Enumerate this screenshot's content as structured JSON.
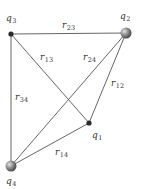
{
  "diagram": {
    "type": "point-charge-distances",
    "line_color": "#555555",
    "charges": [
      {
        "id": "q1",
        "symbol": "q",
        "sub": "1",
        "x": 89,
        "y": 123,
        "kind": "small-dot",
        "label_x": 92,
        "label_y": 138
      },
      {
        "id": "q2",
        "symbol": "q",
        "sub": "2",
        "x": 126,
        "y": 33,
        "kind": "sphere",
        "label_x": 120,
        "label_y": 19
      },
      {
        "id": "q3",
        "symbol": "q",
        "sub": "3",
        "x": 11,
        "y": 34,
        "kind": "small-dot",
        "label_x": 6,
        "label_y": 21
      },
      {
        "id": "q4",
        "symbol": "q",
        "sub": "4",
        "x": 11,
        "y": 166,
        "kind": "sphere",
        "label_x": 6,
        "label_y": 184
      }
    ],
    "distances": [
      {
        "id": "r12",
        "symbol": "r",
        "sub": "12",
        "from": "q1",
        "to": "q2",
        "label_x": 111,
        "label_y": 86
      },
      {
        "id": "r13",
        "symbol": "r",
        "sub": "13",
        "from": "q1",
        "to": "q3",
        "label_x": 40,
        "label_y": 60
      },
      {
        "id": "r14",
        "symbol": "r",
        "sub": "14",
        "from": "q1",
        "to": "q4",
        "label_x": 55,
        "label_y": 155
      },
      {
        "id": "r23",
        "symbol": "r",
        "sub": "23",
        "from": "q2",
        "to": "q3",
        "label_x": 62,
        "label_y": 28
      },
      {
        "id": "r24",
        "symbol": "r",
        "sub": "24",
        "from": "q2",
        "to": "q4",
        "label_x": 83,
        "label_y": 60
      },
      {
        "id": "r34",
        "symbol": "r",
        "sub": "34",
        "from": "q3",
        "to": "q4",
        "label_x": 15,
        "label_y": 100
      }
    ]
  }
}
